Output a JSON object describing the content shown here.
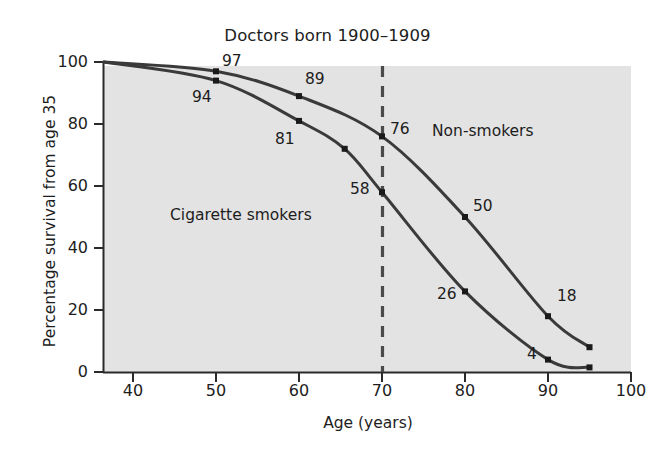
{
  "chart_data": {
    "type": "line",
    "title": "Doctors born 1900–1909",
    "xlabel": "Age (years)",
    "ylabel": "Percentage survival from age 35",
    "xlim": [
      36.5,
      100
    ],
    "ylim": [
      0,
      100
    ],
    "grid": false,
    "legend_position": "inline-annotation",
    "xticks": [
      40,
      50,
      60,
      70,
      80,
      90,
      100
    ],
    "yticks": [
      0,
      20,
      40,
      60,
      80,
      100
    ],
    "plot_background": "#e3e3e3",
    "line_color": "#3a3a3a",
    "annotation_line": {
      "name": "age-70-marker",
      "x": 70,
      "style": "dashed"
    },
    "series": [
      {
        "name": "Non-smokers",
        "x": [
          36.5,
          50,
          60,
          70,
          80,
          90,
          95
        ],
        "values": [
          100,
          97,
          89,
          76,
          50,
          18,
          8
        ],
        "labels": [
          "",
          "97",
          "89",
          "76",
          "50",
          "18",
          ""
        ],
        "label_at": [
          50,
          60,
          70,
          80,
          90
        ]
      },
      {
        "name": "Cigarette smokers",
        "x": [
          36.5,
          50,
          60,
          65.5,
          70,
          80,
          90,
          95
        ],
        "values": [
          100,
          94,
          81,
          72,
          58,
          26,
          4,
          1.5
        ],
        "labels": [
          "",
          "94",
          "81",
          "",
          "58",
          "26",
          "4",
          ""
        ],
        "label_at": [
          50,
          60,
          70,
          80,
          90
        ]
      }
    ]
  },
  "title": "Doctors born 1900–1909",
  "axes": {
    "x_label": "Age (years)",
    "y_label": "Percentage survival from age 35",
    "x_ticks": [
      "40",
      "50",
      "60",
      "70",
      "80",
      "90",
      "100"
    ],
    "y_ticks": [
      "100",
      "80",
      "60",
      "40",
      "20",
      "0"
    ]
  },
  "series_labels": {
    "non_smokers": "Non-smokers",
    "cigarette_smokers": "Cigarette smokers"
  },
  "point_labels": {
    "ns_50": "97",
    "ns_60": "89",
    "ns_70": "76",
    "ns_80": "50",
    "ns_90": "18",
    "cs_50": "94",
    "cs_60": "81",
    "cs_70": "58",
    "cs_80": "26",
    "cs_90": "4"
  }
}
